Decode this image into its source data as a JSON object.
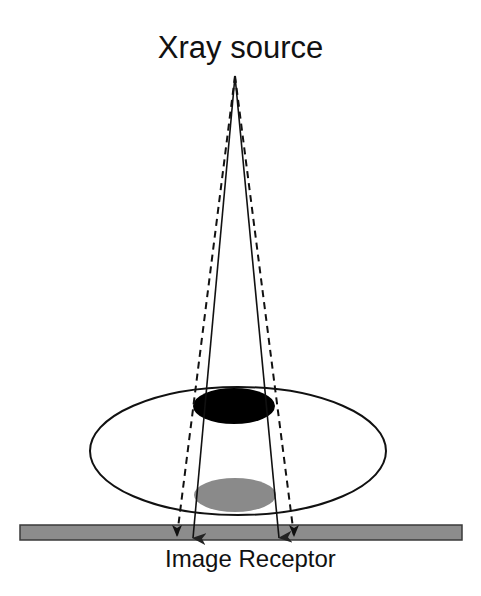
{
  "labels": {
    "source": "Xray source",
    "receptor": "Image Receptor"
  },
  "colors": {
    "background": "#ffffff",
    "line": "#111111",
    "object_dark": "#000000",
    "shadow_gray": "#8a8a8a",
    "receptor_fill": "#8c8c8c",
    "receptor_stroke": "#3a3a3a"
  },
  "geometry": {
    "source_point": {
      "x": 235,
      "y": 76
    },
    "body_ellipse": {
      "cx": 238,
      "cy": 451,
      "rx": 148,
      "ry": 64
    },
    "object_ellipse": {
      "cx": 234,
      "cy": 406,
      "rx": 41,
      "ry": 18
    },
    "projection_ellipse": {
      "cx": 235,
      "cy": 495,
      "rx": 41,
      "ry": 17
    },
    "receptor_bar": {
      "x": 20,
      "y": 525,
      "width": 442,
      "height": 15
    },
    "rays": [
      {
        "name": "dashed-left",
        "style": "dashed",
        "tip": {
          "x": 177,
          "y": 536
        }
      },
      {
        "name": "solid-left",
        "style": "solid",
        "tip": {
          "x": 193,
          "y": 538
        }
      },
      {
        "name": "solid-right",
        "style": "solid",
        "tip": {
          "x": 279,
          "y": 538
        }
      },
      {
        "name": "dashed-right",
        "style": "dashed",
        "tip": {
          "x": 294,
          "y": 536
        }
      }
    ]
  }
}
